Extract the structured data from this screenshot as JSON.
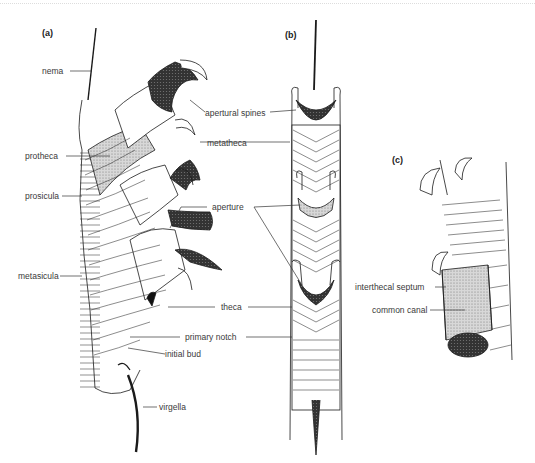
{
  "figure": {
    "panels": [
      {
        "id": "a",
        "label": "(a)"
      },
      {
        "id": "b",
        "label": "(b)"
      },
      {
        "id": "c",
        "label": "(c)"
      }
    ],
    "labels": {
      "nema": "nema",
      "apertural_spines": "apertural spines",
      "protheca": "protheca",
      "metatheca": "metatheca",
      "prosicula": "prosicula",
      "aperture": "aperture",
      "metasicula": "metasicula",
      "theca": "theca",
      "primary_notch": "primary notch",
      "initial_bud": "initial bud",
      "virgella": "virgella",
      "interthecal_septum": "interthecal septum",
      "common_canal": "common canal"
    },
    "colors": {
      "ink": "#1a1a1a",
      "stipple": "#9a9a9a",
      "label_text": "#3a3a3a",
      "background": "#ffffff"
    }
  }
}
